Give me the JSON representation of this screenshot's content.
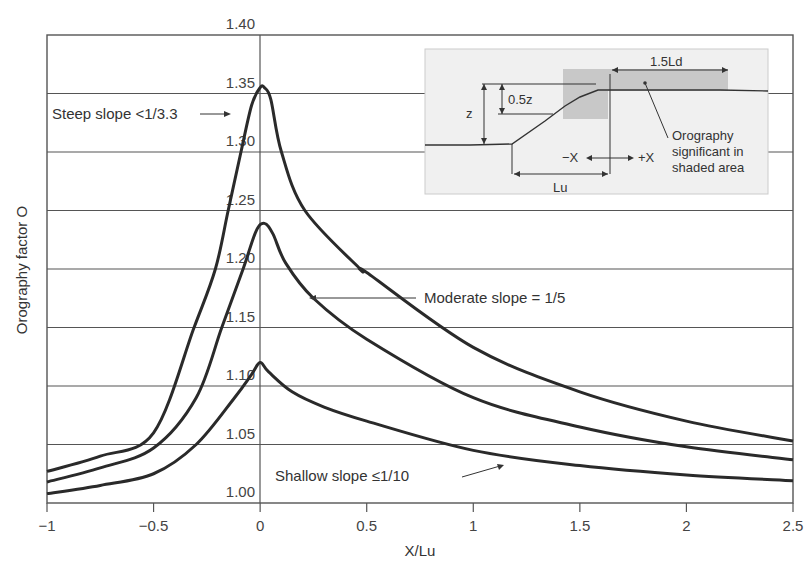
{
  "chart_data": {
    "type": "line",
    "title": "",
    "xlabel": "X/Lu",
    "ylabel": "Orography factor O",
    "xlim": [
      -1,
      2.5
    ],
    "ylim": [
      1.0,
      1.4
    ],
    "xticks": [
      -1,
      -0.5,
      0,
      0.5,
      1,
      1.5,
      2,
      2.5
    ],
    "xtick_labels": [
      "−1",
      "−0.5",
      "0",
      "0.5",
      "1",
      "1.5",
      "2",
      "2.5"
    ],
    "yticks": [
      1.0,
      1.05,
      1.1,
      1.15,
      1.2,
      1.25,
      1.3,
      1.35,
      1.4
    ],
    "ytick_labels": [
      "1.00",
      "1.05",
      "1.10",
      "1.15",
      "1.20",
      "1.25",
      "1.30",
      "1.35",
      "1.40"
    ],
    "grid": "horizontal",
    "series": [
      {
        "name": "Steep slope <1/3.3",
        "x": [
          -1,
          -0.75,
          -0.5,
          -0.31,
          -0.21,
          -0.15,
          -0.09,
          -0.04,
          0,
          0.02,
          0.05,
          0.1,
          0.21,
          0.47,
          0.5,
          1,
          1.5,
          2,
          2.5
        ],
        "values": [
          1.027,
          1.04,
          1.06,
          1.15,
          1.2,
          1.25,
          1.3,
          1.34,
          1.355,
          1.355,
          1.345,
          1.3,
          1.25,
          1.2,
          1.197,
          1.133,
          1.095,
          1.07,
          1.053
        ]
      },
      {
        "name": "Moderate slope = 1/5",
        "x": [
          -1,
          -0.75,
          -0.5,
          -0.3,
          -0.18,
          -0.08,
          -0.02,
          0.02,
          0.06,
          0.12,
          0.25,
          0.5,
          1,
          1.5,
          2,
          2.5
        ],
        "values": [
          1.018,
          1.03,
          1.047,
          1.09,
          1.15,
          1.2,
          1.232,
          1.239,
          1.23,
          1.205,
          1.175,
          1.14,
          1.09,
          1.065,
          1.048,
          1.037
        ],
        "label_value": "1/5"
      },
      {
        "name": "Shallow slope ≤1/10",
        "x": [
          -1,
          -0.75,
          -0.5,
          -0.3,
          -0.12,
          -0.04,
          0,
          0.04,
          0.15,
          0.3,
          0.5,
          1,
          1.5,
          2,
          2.5
        ],
        "values": [
          1.008,
          1.015,
          1.025,
          1.05,
          1.09,
          1.11,
          1.12,
          1.112,
          1.095,
          1.082,
          1.07,
          1.045,
          1.032,
          1.024,
          1.019
        ]
      }
    ],
    "annotations": [
      {
        "text": "Steep slope <1/3.3 →",
        "series": "Steep slope <1/3.3"
      },
      {
        "text": "Moderate slope = 1/5",
        "series": "Moderate slope = 1/5"
      },
      {
        "text": "Shallow slope ≤1/10",
        "series": "Shallow slope ≤1/10"
      }
    ],
    "inset": {
      "labels": [
        "1.5Ld",
        "0.5z",
        "z",
        "−X",
        "+X",
        "Lu",
        "Orography",
        "significant in",
        "shaded area"
      ]
    }
  },
  "labels": {
    "xlabel": "X/Lu",
    "ylabel": "Orography factor O",
    "steep": "Steep slope <1/3.3",
    "moderate": "Moderate slope = 1/5",
    "shallow": "Shallow slope ≤1/10",
    "inset_ld": "1.5Ld",
    "inset_half_z": "0.5z",
    "inset_z": "z",
    "inset_minus_x": "−X",
    "inset_plus_x": "+X",
    "inset_lu": "Lu",
    "inset_note_1": "Orography",
    "inset_note_2": "significant in",
    "inset_note_3": "shaded area"
  },
  "colors": {
    "curve": "#2a2a2a",
    "grid": "#555555",
    "inset_bg": "#f0f0f0",
    "inset_shade": "#c8c8c8"
  }
}
